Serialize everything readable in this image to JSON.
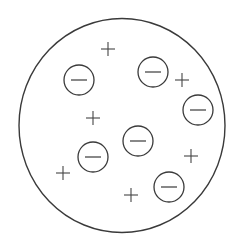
{
  "diagram": {
    "stroke_color": "#3a3a3a",
    "plus_color": "#444444",
    "background": "#ffffff",
    "outer_sphere": {
      "cx": 122,
      "cy": 125.5,
      "rx": 103,
      "ry": 107
    },
    "negative_charges": [
      {
        "cx": 79,
        "cy": 80,
        "r": 15,
        "symbol": "minus"
      },
      {
        "cx": 153,
        "cy": 72,
        "r": 15,
        "symbol": "minus"
      },
      {
        "cx": 198,
        "cy": 110,
        "r": 15,
        "symbol": "minus"
      },
      {
        "cx": 138,
        "cy": 141,
        "r": 15,
        "symbol": "minus"
      },
      {
        "cx": 93,
        "cy": 157,
        "r": 15,
        "symbol": "minus"
      },
      {
        "cx": 169,
        "cy": 187,
        "r": 15,
        "symbol": "minus"
      }
    ],
    "positive_charges": [
      {
        "cx": 108,
        "cy": 49,
        "symbol": "plus"
      },
      {
        "cx": 182,
        "cy": 80,
        "symbol": "plus"
      },
      {
        "cx": 93,
        "cy": 118,
        "symbol": "plus"
      },
      {
        "cx": 191,
        "cy": 156,
        "symbol": "plus"
      },
      {
        "cx": 63,
        "cy": 173,
        "symbol": "plus"
      },
      {
        "cx": 131,
        "cy": 195,
        "symbol": "plus"
      }
    ],
    "counts": {
      "negative": 6,
      "positive": 6
    }
  }
}
